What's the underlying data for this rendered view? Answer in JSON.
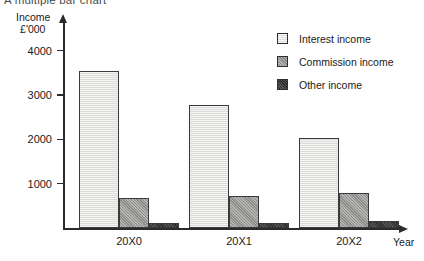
{
  "chart_data": {
    "type": "bar",
    "title": "A multiple bar chart",
    "xlabel": "Year",
    "ylabel": "Income",
    "ylabel_unit": "£'000",
    "categories": [
      "20X0",
      "20X1",
      "20X2"
    ],
    "series": [
      {
        "name": "Interest income",
        "values": [
          3550,
          2780,
          2030
        ],
        "color": "#ececea"
      },
      {
        "name": "Commission income",
        "values": [
          680,
          730,
          790
        ],
        "color": "#9d9d9b"
      },
      {
        "name": "Other income",
        "values": [
          120,
          110,
          150
        ],
        "color": "#3b3b3b"
      }
    ],
    "yticks": [
      1000,
      2000,
      3000,
      4000
    ],
    "ytick_labels": [
      "1000",
      "2000",
      "3000",
      "4000"
    ],
    "ylim": [
      0,
      4700
    ],
    "grid": false,
    "legend_position": "top-right"
  }
}
